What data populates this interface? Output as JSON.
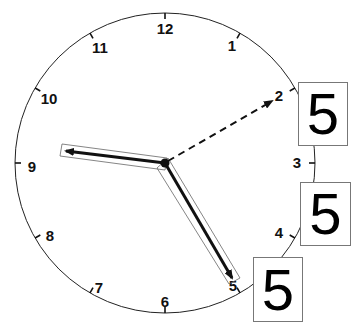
{
  "clock": {
    "numbers": [
      "12",
      "1",
      "2",
      "3",
      "4",
      "5",
      "6",
      "7",
      "8",
      "9",
      "10",
      "11"
    ],
    "center": [
      165,
      163
    ],
    "radius": 150,
    "hands": {
      "hour_hand_target": "9",
      "minute_hand_target": "5",
      "dashed_hand_target": "2"
    },
    "colors": {
      "face": "#ffffff",
      "stroke": "#111111",
      "box_border": "#777777"
    }
  },
  "boxes": [
    {
      "label": "5",
      "near": "2"
    },
    {
      "label": "5",
      "near": "4"
    },
    {
      "label": "5",
      "near": "5"
    }
  ]
}
